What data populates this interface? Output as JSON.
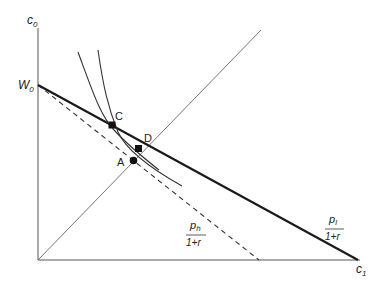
{
  "diagram": {
    "axes": {
      "y_label": "c",
      "y_sub": "0",
      "x_label": "c",
      "x_sub": "1",
      "intercept_label": "W",
      "intercept_sub": "0"
    },
    "points": [
      {
        "id": "C",
        "label": "C",
        "marker": "square"
      },
      {
        "id": "D",
        "label": "D",
        "marker": "square"
      },
      {
        "id": "A",
        "label": "A",
        "marker": "circle"
      }
    ],
    "slopes": {
      "high": {
        "num": "p",
        "num_sub": "h",
        "den": "1+r"
      },
      "low": {
        "num": "p",
        "num_sub": "l",
        "den": "1+r"
      }
    },
    "lines": [
      {
        "name": "budget-line-low",
        "style": "solid-thick"
      },
      {
        "name": "budget-line-high",
        "style": "dashed"
      },
      {
        "name": "45-degree-line",
        "style": "solid-thin"
      },
      {
        "name": "indifference-curve-1",
        "style": "solid-curve"
      },
      {
        "name": "indifference-curve-2",
        "style": "solid-curve"
      }
    ],
    "colors": {
      "ink": "#222222",
      "thin": "#555555"
    }
  }
}
